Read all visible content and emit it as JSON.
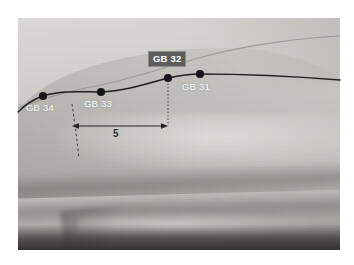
{
  "figure": {
    "kind": "acupuncture-point-photo-diagram",
    "region": "lateral thigh",
    "alt": "Grayscale photograph of a lateral thigh with the Gall Bladder meridian drawn as a dark line and four marked points"
  },
  "meridian": {
    "name": "gall-bladder-meridian",
    "line_color": "#231f20"
  },
  "points": [
    {
      "id": "gb34",
      "label": "GB 34",
      "x": 43,
      "y": 96,
      "label_x": 26,
      "label_y": 102,
      "boxed": false
    },
    {
      "id": "gb33",
      "label": "GB 33",
      "x": 101,
      "y": 92,
      "label_x": 84,
      "label_y": 98,
      "boxed": false
    },
    {
      "id": "gb32",
      "label": "GB 32",
      "x": 168,
      "y": 78,
      "label_x": 148,
      "label_y": 51,
      "boxed": true
    },
    {
      "id": "gb31",
      "label": "GB 31",
      "x": 200,
      "y": 74,
      "label_x": 182,
      "label_y": 81,
      "boxed": false
    }
  ],
  "measurement": {
    "value": "5",
    "unit_implied": "cun",
    "arrow_color": "#232323",
    "from_x": 72,
    "to_x": 168,
    "y": 126
  },
  "guides": [
    {
      "id": "guide-left",
      "x_top": 72,
      "y_top": 104,
      "x_bottom": 79,
      "y_bottom": 158
    },
    {
      "id": "guide-right",
      "x_top": 168,
      "y_top": 80,
      "x_bottom": 168,
      "y_bottom": 126
    }
  ],
  "colors": {
    "page_background": "#ffffff",
    "label_text": "#ffffff",
    "label_box_background": "#5d5d5d",
    "measurement_text": "#282828",
    "point_fill": "#17161a"
  }
}
